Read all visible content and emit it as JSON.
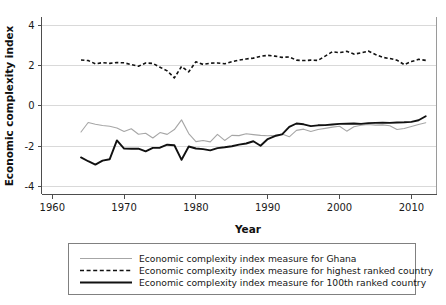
{
  "chart_data": {
    "type": "line",
    "title": "",
    "xlabel": "Year",
    "ylabel": "Economic complexity index",
    "xlim": [
      1958.5,
      2013.5
    ],
    "ylim": [
      -4.4,
      4.4
    ],
    "xticks": [
      1960,
      1970,
      1980,
      1990,
      2000,
      2010
    ],
    "xtick_labels": [
      "1960",
      "1970",
      "1980",
      "1990",
      "2000",
      "2010"
    ],
    "yticks": [
      4,
      2,
      0,
      -2,
      -4
    ],
    "ytick_labels": [
      "4",
      "2",
      "0",
      "-2",
      "-4"
    ],
    "grid": "horizontal",
    "legend_position": "below-plot",
    "x": [
      1964,
      1965,
      1966,
      1967,
      1968,
      1969,
      1970,
      1971,
      1972,
      1973,
      1974,
      1975,
      1976,
      1977,
      1978,
      1979,
      1980,
      1981,
      1982,
      1983,
      1984,
      1985,
      1986,
      1987,
      1988,
      1989,
      1990,
      1991,
      1992,
      1993,
      1994,
      1995,
      1996,
      1997,
      1998,
      1999,
      2000,
      2001,
      2002,
      2003,
      2004,
      2005,
      2006,
      2007,
      2008,
      2009,
      2010,
      2011,
      2012
    ],
    "series": [
      {
        "name": "Economic complexity index measure for Ghana",
        "style": "thin-solid-gray",
        "color": "#a6a6a6",
        "values": [
          -1.3,
          -0.83,
          -0.92,
          -0.98,
          -1.02,
          -1.1,
          -1.28,
          -1.14,
          -1.41,
          -1.36,
          -1.6,
          -1.33,
          -1.42,
          -1.18,
          -0.7,
          -1.38,
          -1.78,
          -1.72,
          -1.79,
          -1.42,
          -1.72,
          -1.47,
          -1.48,
          -1.39,
          -1.43,
          -1.47,
          -1.49,
          -1.47,
          -1.4,
          -1.54,
          -1.22,
          -1.16,
          -1.28,
          -1.18,
          -1.12,
          -1.06,
          -1.02,
          -1.26,
          -1.04,
          -0.97,
          -0.93,
          -0.96,
          -0.95,
          -0.99,
          -1.18,
          -1.13,
          -1.03,
          -0.93,
          -0.84
        ]
      },
      {
        "name": "Economic complexity index measure for highest ranked country",
        "style": "dashed-black",
        "color": "#111111",
        "values": [
          2.27,
          2.24,
          2.08,
          2.14,
          2.1,
          2.14,
          2.13,
          2.04,
          1.96,
          2.12,
          2.1,
          1.91,
          1.73,
          1.38,
          1.95,
          1.68,
          2.18,
          2.05,
          2.11,
          2.12,
          2.08,
          2.18,
          2.26,
          2.32,
          2.36,
          2.45,
          2.5,
          2.46,
          2.4,
          2.42,
          2.26,
          2.24,
          2.26,
          2.25,
          2.46,
          2.68,
          2.63,
          2.7,
          2.56,
          2.62,
          2.71,
          2.54,
          2.4,
          2.34,
          2.26,
          2.04,
          2.19,
          2.3,
          2.25
        ]
      },
      {
        "name": "Economic complexity index measure for 100th ranked country",
        "style": "thick-solid-black",
        "color": "#111111",
        "values": [
          -2.56,
          -2.75,
          -2.92,
          -2.72,
          -2.65,
          -1.72,
          -2.12,
          -2.13,
          -2.13,
          -2.26,
          -2.09,
          -2.08,
          -1.93,
          -1.96,
          -2.68,
          -2.02,
          -2.12,
          -2.15,
          -2.21,
          -2.1,
          -2.06,
          -2.01,
          -1.93,
          -1.87,
          -1.76,
          -1.98,
          -1.65,
          -1.5,
          -1.42,
          -1.05,
          -0.88,
          -0.92,
          -1.01,
          -0.97,
          -0.96,
          -0.93,
          -0.9,
          -0.89,
          -0.88,
          -0.9,
          -0.86,
          -0.85,
          -0.84,
          -0.85,
          -0.83,
          -0.82,
          -0.8,
          -0.72,
          -0.52
        ]
      }
    ]
  },
  "legend": {
    "entries": [
      {
        "label": "Economic complexity index measure for Ghana",
        "style": "thin-solid-gray"
      },
      {
        "label": "Economic complexity index measure for highest ranked country",
        "style": "dashed-black"
      },
      {
        "label": "Economic complexity index measure for 100th ranked country",
        "style": "thick-solid-black"
      }
    ]
  },
  "colors": {
    "ghana": "#a6a6a6",
    "highest": "#111111",
    "hundredth": "#111111",
    "grid": "#d9d9d9",
    "axis": "#4d4d4d",
    "legend_border": "#808080",
    "background": "#ffffff"
  }
}
